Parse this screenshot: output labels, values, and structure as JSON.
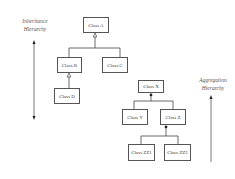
{
  "labels": {
    "inheritance": [
      "Inheritance",
      "Hierarchy"
    ],
    "aggregation": [
      "Aggregation",
      "Hierarchy"
    ]
  },
  "classes": {
    "a": "Class A",
    "b": "Class B",
    "c": "Class C",
    "d": "Class D",
    "x": "Class X",
    "y": "Class Y",
    "z": "Class Z",
    "zz1": "Class ZZ1",
    "zz2": "Class ZZ2"
  },
  "relations": {
    "inheritance": [
      [
        "b",
        "a"
      ],
      [
        "c",
        "a"
      ],
      [
        "d",
        "b"
      ]
    ],
    "aggregation": [
      [
        "y",
        "x"
      ],
      [
        "z",
        "x"
      ],
      [
        "zz1",
        "z"
      ],
      [
        "zz2",
        "z"
      ]
    ]
  }
}
